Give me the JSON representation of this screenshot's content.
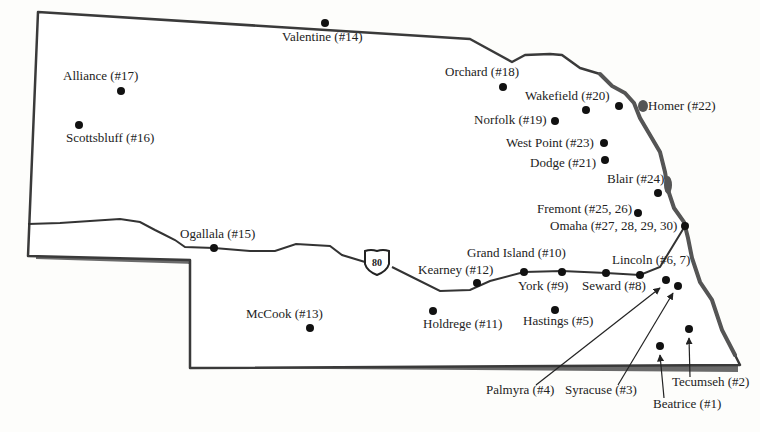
{
  "map": {
    "region": "Nebraska",
    "colors": {
      "background": "#fdfdfb",
      "border": "#3a3a3a",
      "shadow": "#6a6a6a",
      "river": "#555555",
      "highway": "#333333",
      "dot": "#111111",
      "text": "#222222"
    },
    "highway": {
      "label": "80",
      "name": "I-80"
    },
    "cities": [
      {
        "name": "Beatrice",
        "label": "Beatrice (#1)",
        "x": 660,
        "y": 346,
        "lx": 653,
        "ly": 408,
        "anchor": "start"
      },
      {
        "name": "Tecumseh",
        "label": "Tecumseh (#2)",
        "x": 689,
        "y": 329,
        "lx": 672,
        "ly": 386,
        "anchor": "start"
      },
      {
        "name": "Syracuse",
        "label": "Syracuse (#3)",
        "x": 678,
        "y": 286,
        "lx": 565,
        "ly": 394,
        "anchor": "start"
      },
      {
        "name": "Palmyra",
        "label": "Palmyra (#4)",
        "x": 666,
        "y": 280,
        "lx": 486,
        "ly": 394,
        "anchor": "start"
      },
      {
        "name": "Hastings",
        "label": "Hastings (#5)",
        "x": 555,
        "y": 310,
        "lx": 523,
        "ly": 325,
        "anchor": "start"
      },
      {
        "name": "Lincoln",
        "label": "Lincoln  (#6, 7)",
        "x": 640,
        "y": 275,
        "lx": 612,
        "ly": 264,
        "anchor": "start"
      },
      {
        "name": "Seward",
        "label": "Seward (#8)",
        "x": 606,
        "y": 273,
        "lx": 582,
        "ly": 290,
        "anchor": "start"
      },
      {
        "name": "York",
        "label": "York (#9)",
        "x": 562,
        "y": 272,
        "lx": 518,
        "ly": 290,
        "anchor": "start"
      },
      {
        "name": "Grand Island",
        "label": "Grand Island (#10)",
        "x": 524,
        "y": 272,
        "lx": 467,
        "ly": 257,
        "anchor": "start"
      },
      {
        "name": "Holdrege",
        "label": "Holdrege (#11)",
        "x": 433,
        "y": 311,
        "lx": 423,
        "ly": 328,
        "anchor": "start"
      },
      {
        "name": "Kearney",
        "label": "Kearney (#12)",
        "x": 477,
        "y": 283,
        "lx": 418,
        "ly": 274,
        "anchor": "start"
      },
      {
        "name": "McCook",
        "label": "McCook (#13)",
        "x": 310,
        "y": 328,
        "lx": 246,
        "ly": 318,
        "anchor": "start"
      },
      {
        "name": "Valentine",
        "label": "Valentine (#14)",
        "x": 325,
        "y": 23,
        "lx": 282,
        "ly": 41,
        "anchor": "start"
      },
      {
        "name": "Ogallala",
        "label": "Ogallala (#15)",
        "x": 214,
        "y": 248,
        "lx": 180,
        "ly": 238,
        "anchor": "start"
      },
      {
        "name": "Scottsbluff",
        "label": "Scottsbluff (#16)",
        "x": 79,
        "y": 125,
        "lx": 66,
        "ly": 142,
        "anchor": "start"
      },
      {
        "name": "Alliance",
        "label": "Alliance (#17)",
        "x": 121,
        "y": 91,
        "lx": 63,
        "ly": 80,
        "anchor": "start"
      },
      {
        "name": "Orchard",
        "label": "Orchard (#18)",
        "x": 503,
        "y": 87,
        "lx": 445,
        "ly": 76,
        "anchor": "start"
      },
      {
        "name": "Norfolk",
        "label": "Norfolk (#19)",
        "x": 555,
        "y": 121,
        "lx": 474,
        "ly": 124,
        "anchor": "start"
      },
      {
        "name": "Wakefield",
        "label": "Wakefield (#20)",
        "x": 586,
        "y": 110,
        "lx": 525,
        "ly": 100,
        "anchor": "start"
      },
      {
        "name": "Dodge",
        "label": "Dodge (#21)",
        "x": 605,
        "y": 160,
        "lx": 530,
        "ly": 167,
        "anchor": "start"
      },
      {
        "name": "Homer",
        "label": "Homer (#22)",
        "x": 619,
        "y": 106,
        "lx": 648,
        "ly": 110,
        "anchor": "start"
      },
      {
        "name": "West Point",
        "label": "West Point (#23)",
        "x": 604,
        "y": 143,
        "lx": 506,
        "ly": 147,
        "anchor": "start"
      },
      {
        "name": "Blair",
        "label": "Blair (#24)",
        "x": 658,
        "y": 193,
        "lx": 607,
        "ly": 183,
        "anchor": "start"
      },
      {
        "name": "Fremont",
        "label": "Fremont (#25, 26)",
        "x": 638,
        "y": 213,
        "lx": 537,
        "ly": 213,
        "anchor": "start"
      },
      {
        "name": "Omaha",
        "label": "Omaha (#27, 28, 29, 30)",
        "x": 685,
        "y": 226,
        "lx": 550,
        "ly": 230,
        "anchor": "start"
      }
    ],
    "pointer_lines": [
      {
        "for": "Palmyra",
        "x1": 536,
        "y1": 385,
        "x2": 660,
        "y2": 288
      },
      {
        "for": "Syracuse",
        "x1": 618,
        "y1": 385,
        "x2": 673,
        "y2": 293
      },
      {
        "for": "Beatrice",
        "x1": 664,
        "y1": 398,
        "x2": 660,
        "y2": 355
      },
      {
        "for": "Tecumseh",
        "x1": 690,
        "y1": 377,
        "x2": 689,
        "y2": 338
      }
    ]
  }
}
